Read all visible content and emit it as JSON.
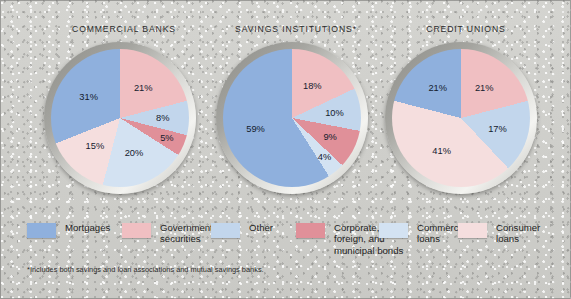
{
  "figure": {
    "background_color": "#cfcfcb",
    "footnote": "*Includes both savings and loan associations and mutual savings banks."
  },
  "legend": {
    "items": [
      {
        "label": "Mortgages",
        "color": "#8fb0dd"
      },
      {
        "label": "Government\nsecurities",
        "color": "#f0bfc2"
      },
      {
        "label": "Other",
        "color": "#c2d6ec"
      },
      {
        "label": "Corporate,\nforeign, and\nmunicipal bonds",
        "color": "#e09099"
      },
      {
        "label": "Commercial\nloans",
        "color": "#d3e2f2"
      },
      {
        "label": "Consumer\nloans",
        "color": "#f5dede"
      }
    ]
  },
  "chart_data": {
    "type": "pie",
    "title": "",
    "legend_position": "bottom",
    "categories": [
      "Mortgages",
      "Government securities",
      "Other",
      "Corporate, foreign, and municipal bonds",
      "Commercial loans",
      "Consumer loans"
    ],
    "colors": [
      "#8fb0dd",
      "#f0bfc2",
      "#c2d6ec",
      "#e09099",
      "#d3e2f2",
      "#f5dede"
    ],
    "units": "percent",
    "charts": [
      {
        "title": "COMMERCIAL BANKS",
        "slices": [
          {
            "label": "21%",
            "value": 21,
            "category": "Government securities",
            "color": "#f0bfc2"
          },
          {
            "label": "8%",
            "value": 8,
            "category": "Other",
            "color": "#c2d6ec"
          },
          {
            "label": "5%",
            "value": 5,
            "category": "Corporate, foreign, and municipal bonds",
            "color": "#e09099"
          },
          {
            "label": "20%",
            "value": 20,
            "category": "Commercial loans",
            "color": "#d3e2f2"
          },
          {
            "label": "15%",
            "value": 15,
            "category": "Consumer loans",
            "color": "#f5dede"
          },
          {
            "label": "31%",
            "value": 31,
            "category": "Mortgages",
            "color": "#8fb0dd"
          }
        ]
      },
      {
        "title": "SAVINGS INSTITUTIONS*",
        "slices": [
          {
            "label": "18%",
            "value": 18,
            "category": "Government securities",
            "color": "#f0bfc2"
          },
          {
            "label": "10%",
            "value": 10,
            "category": "Other",
            "color": "#c2d6ec"
          },
          {
            "label": "9%",
            "value": 9,
            "category": "Corporate, foreign, and municipal bonds",
            "color": "#e09099"
          },
          {
            "label": "4%",
            "value": 4,
            "category": "Commercial loans",
            "color": "#d3e2f2"
          },
          {
            "label": "59%",
            "value": 59,
            "category": "Mortgages",
            "color": "#8fb0dd"
          }
        ]
      },
      {
        "title": "CREDIT UNIONS",
        "slices": [
          {
            "label": "21%",
            "value": 21,
            "category": "Government securities",
            "color": "#f0bfc2"
          },
          {
            "label": "17%",
            "value": 17,
            "category": "Other",
            "color": "#c2d6ec"
          },
          {
            "label": "41%",
            "value": 41,
            "category": "Consumer loans",
            "color": "#f5dede"
          },
          {
            "label": "21%",
            "value": 21,
            "category": "Mortgages",
            "color": "#8fb0dd"
          }
        ]
      }
    ]
  }
}
